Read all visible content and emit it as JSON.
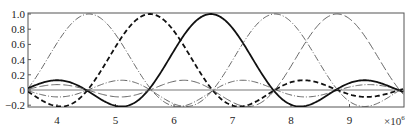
{
  "chart_data": {
    "type": "line",
    "title": "",
    "xlabel": "",
    "ylabel": "",
    "x_multiplier": "×10",
    "x_multiplier_exponent": "6",
    "xlim": [
      3.5,
      9.93
    ],
    "ylim": [
      -0.22,
      1.02
    ],
    "grid": false,
    "legend": null,
    "x_ticks": [
      4,
      5,
      6,
      7,
      8,
      9
    ],
    "x_tick_labels": [
      "4",
      "5",
      "6",
      "7",
      "8",
      "9"
    ],
    "y_ticks": [
      -0.2,
      0,
      0.2,
      0.4,
      0.6,
      0.8,
      1.0
    ],
    "y_tick_labels": [
      "-0.2",
      "0",
      "0.2",
      "0.4",
      "0.6",
      "0.8",
      "1.0"
    ],
    "knots": [
      3.5,
      4.55,
      5.59,
      6.63,
      7.73,
      8.79,
      9.9
    ],
    "kernel_width": 1.067,
    "series": [
      {
        "name": "kernel-1",
        "peak_x": 4.55,
        "style": "thin-dashdot",
        "color": "#555555",
        "width": 0.9,
        "samples": {
          "x": [
            3.5,
            4.02,
            4.55,
            5.07,
            5.59,
            6.11,
            6.63,
            7.18,
            7.73,
            8.26,
            8.79,
            9.35,
            9.9
          ],
          "y": [
            0,
            0.64,
            1.0,
            0.64,
            0,
            -0.21,
            0,
            0.13,
            0,
            -0.09,
            0,
            0.07,
            0
          ]
        }
      },
      {
        "name": "kernel-2",
        "peak_x": 5.59,
        "style": "thick-dashed",
        "color": "#111111",
        "width": 1.8,
        "samples": {
          "x": [
            3.5,
            4.02,
            4.55,
            5.07,
            5.59,
            6.11,
            6.63,
            7.18,
            7.73,
            8.26,
            8.79,
            9.35,
            9.9
          ],
          "y": [
            0,
            -0.21,
            0,
            0.64,
            1.0,
            0.64,
            0,
            -0.21,
            0,
            0.13,
            0,
            -0.09,
            0
          ]
        }
      },
      {
        "name": "kernel-3",
        "peak_x": 6.63,
        "style": "thick-solid",
        "color": "#111111",
        "width": 1.8,
        "samples": {
          "x": [
            3.5,
            4.02,
            4.55,
            5.07,
            5.59,
            6.11,
            6.63,
            7.18,
            7.73,
            8.26,
            8.79,
            9.35,
            9.9
          ],
          "y": [
            0,
            0.13,
            0,
            -0.21,
            0,
            0.64,
            1.0,
            0.64,
            0,
            -0.21,
            0,
            0.13,
            0
          ]
        }
      },
      {
        "name": "kernel-4",
        "peak_x": 7.73,
        "style": "thin-dashdot",
        "color": "#555555",
        "width": 0.9,
        "samples": {
          "x": [
            3.5,
            4.02,
            4.55,
            5.07,
            5.59,
            6.11,
            6.63,
            7.18,
            7.73,
            8.26,
            8.79,
            9.35,
            9.9
          ],
          "y": [
            0,
            -0.09,
            0,
            0.13,
            0,
            -0.21,
            0,
            0.64,
            1.0,
            0.64,
            0,
            -0.21,
            0
          ]
        }
      },
      {
        "name": "kernel-5",
        "peak_x": 8.79,
        "style": "thin-longdash",
        "color": "#555555",
        "width": 0.9,
        "samples": {
          "x": [
            3.5,
            4.02,
            4.55,
            5.07,
            5.59,
            6.11,
            6.63,
            7.18,
            7.73,
            8.26,
            8.79,
            9.35,
            9.9
          ],
          "y": [
            0,
            0.07,
            0,
            -0.09,
            0,
            0.13,
            0,
            -0.21,
            0,
            0.64,
            1.0,
            0.64,
            0
          ]
        }
      }
    ]
  },
  "axes": {
    "frame_color": "#555555",
    "zero_line_color": "#555555"
  }
}
